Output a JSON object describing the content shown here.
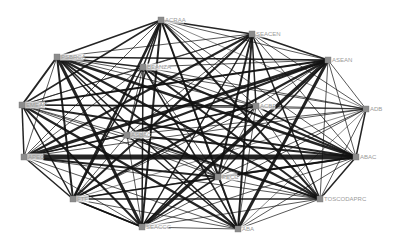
{
  "diagram": {
    "type": "network-graph",
    "nodes": [
      {
        "id": "ACRAA",
        "label": "ACRAA",
        "x": 161,
        "y": 20
      },
      {
        "id": "SEACEN",
        "label": "SEACEN",
        "x": 252,
        "y": 34
      },
      {
        "id": "ASEAN",
        "label": "ASEAN",
        "x": 328,
        "y": 60
      },
      {
        "id": "PSBRCA",
        "label": "PSBRCA",
        "x": 57,
        "y": 57
      },
      {
        "id": "BEANZA",
        "label": "BEANZA",
        "x": 143,
        "y": 67
      },
      {
        "id": "EMEAP",
        "label": "EMEAP",
        "x": 22,
        "y": 105
      },
      {
        "id": "ACBF",
        "label": "ACBF",
        "x": 256,
        "y": 106
      },
      {
        "id": "ADB",
        "label": "ADB",
        "x": 366,
        "y": 109
      },
      {
        "id": "ASBAC",
        "label": "ASBAC",
        "x": 127,
        "y": 135
      },
      {
        "id": "APEC",
        "label": "APEC",
        "x": 24,
        "y": 157
      },
      {
        "id": "ABAC",
        "label": "ABAC",
        "x": 356,
        "y": 157
      },
      {
        "id": "PECC",
        "label": "PECC",
        "x": 218,
        "y": 177
      },
      {
        "id": "FTF",
        "label": "FTF",
        "x": 73,
        "y": 199
      },
      {
        "id": "TOSCODAPRC",
        "label": "TOSCODAPRC",
        "x": 320,
        "y": 199
      },
      {
        "id": "ABA",
        "label": "ABA",
        "x": 238,
        "y": 229
      },
      {
        "id": "SEACCC",
        "label": "SEACCC",
        "x": 142,
        "y": 227
      }
    ],
    "edges": [
      [
        "APEC",
        "ABAC",
        5
      ],
      [
        "ASEAN",
        "SEACCC",
        3.5
      ],
      [
        "ASEAN",
        "ABA",
        3
      ],
      [
        "ASEAN",
        "APEC",
        3
      ],
      [
        "PSBRCA",
        "SEACCC",
        3
      ],
      [
        "PSBRCA",
        "TOSCODAPRC",
        2.5
      ],
      [
        "PSBRCA",
        "ABAC",
        2.5
      ],
      [
        "PSBRCA",
        "PECC",
        2
      ],
      [
        "EMEAP",
        "ABA",
        2.5
      ],
      [
        "EMEAP",
        "ABAC",
        2
      ],
      [
        "EMEAP",
        "SEACCC",
        2
      ],
      [
        "EMEAP",
        "ASEAN",
        2
      ],
      [
        "ACRAA",
        "SEACCC",
        2
      ],
      [
        "ACRAA",
        "FTF",
        2.5
      ],
      [
        "ACRAA",
        "TOSCODAPRC",
        2
      ],
      [
        "ACRAA",
        "ABA",
        2
      ],
      [
        "SEACEN",
        "FTF",
        2
      ],
      [
        "SEACEN",
        "APEC",
        2
      ],
      [
        "SEACEN",
        "PECC",
        2
      ],
      [
        "SEACEN",
        "ABA",
        2
      ],
      [
        "BEANZA",
        "ABAC",
        2
      ],
      [
        "BEANZA",
        "TOSCODAPRC",
        2
      ],
      [
        "BEANZA",
        "ABA",
        1.5
      ],
      [
        "BEANZA",
        "FTF",
        1.5
      ],
      [
        "ASBAC",
        "ABAC",
        2
      ],
      [
        "ASBAC",
        "TOSCODAPRC",
        2
      ],
      [
        "ASBAC",
        "ASEAN",
        2
      ],
      [
        "ASBAC",
        "ABA",
        1.5
      ],
      [
        "PECC",
        "ABAC",
        2
      ],
      [
        "PECC",
        "APEC",
        2
      ],
      [
        "PECC",
        "ASEAN",
        1.5
      ],
      [
        "PECC",
        "SEACCC",
        1.5
      ],
      [
        "FTF",
        "TOSCODAPRC",
        1.5
      ],
      [
        "FTF",
        "ABAC",
        1.5
      ],
      [
        "FTF",
        "ASEAN",
        2
      ],
      [
        "FTF",
        "SEACCC",
        1.5
      ],
      [
        "ACBF",
        "APEC",
        1.5
      ],
      [
        "ACBF",
        "SEACCC",
        1.5
      ],
      [
        "ACBF",
        "EMEAP",
        1.5
      ],
      [
        "ACBF",
        "ABAC",
        1.5
      ],
      [
        "ADB",
        "APEC",
        1
      ],
      [
        "ADB",
        "EMEAP",
        1
      ],
      [
        "ADB",
        "PSBRCA",
        1
      ],
      [
        "ADB",
        "SEACCC",
        1
      ],
      [
        "ACRAA",
        "PSBRCA",
        1.5
      ],
      [
        "ACRAA",
        "SEACEN",
        1.5
      ],
      [
        "SEACEN",
        "ASEAN",
        1.5
      ],
      [
        "ASEAN",
        "ADB",
        1
      ],
      [
        "ADB",
        "ABAC",
        1.5
      ],
      [
        "ABAC",
        "TOSCODAPRC",
        1.5
      ],
      [
        "TOSCODAPRC",
        "ABA",
        1
      ],
      [
        "ABA",
        "SEACCC",
        1
      ],
      [
        "SEACCC",
        "FTF",
        1.5
      ],
      [
        "FTF",
        "APEC",
        1.5
      ],
      [
        "APEC",
        "EMEAP",
        1.5
      ],
      [
        "EMEAP",
        "PSBRCA",
        2
      ],
      [
        "PSBRCA",
        "BEANZA",
        1.5
      ],
      [
        "PSBRCA",
        "ASEAN",
        1.5
      ],
      [
        "PSBRCA",
        "SEACEN",
        1
      ],
      [
        "PSBRCA",
        "ASBAC",
        1.5
      ],
      [
        "PSBRCA",
        "FTF",
        2
      ],
      [
        "PSBRCA",
        "APEC",
        1
      ],
      [
        "PSBRCA",
        "ABA",
        1.5
      ],
      [
        "PSBRCA",
        "ACBF",
        1
      ],
      [
        "ACRAA",
        "BEANZA",
        1.5
      ],
      [
        "ACRAA",
        "ASEAN",
        1
      ],
      [
        "ACRAA",
        "EMEAP",
        1.5
      ],
      [
        "ACRAA",
        "ACBF",
        1
      ],
      [
        "ACRAA",
        "ADB",
        0.7
      ],
      [
        "ACRAA",
        "ABAC",
        1
      ],
      [
        "ACRAA",
        "ASBAC",
        1.5
      ],
      [
        "ACRAA",
        "PECC",
        1
      ],
      [
        "ACRAA",
        "APEC",
        1
      ],
      [
        "SEACEN",
        "BEANZA",
        1
      ],
      [
        "SEACEN",
        "EMEAP",
        1
      ],
      [
        "SEACEN",
        "ACBF",
        1.5
      ],
      [
        "SEACEN",
        "ADB",
        1
      ],
      [
        "SEACEN",
        "ABAC",
        1
      ],
      [
        "SEACEN",
        "TOSCODAPRC",
        1.5
      ],
      [
        "SEACEN",
        "ASBAC",
        1
      ],
      [
        "SEACEN",
        "SEACCC",
        1.5
      ],
      [
        "ASEAN",
        "BEANZA",
        1
      ],
      [
        "ASEAN",
        "EMEAP",
        1
      ],
      [
        "ASEAN",
        "ACBF",
        1
      ],
      [
        "ASEAN",
        "ABAC",
        1
      ],
      [
        "ASEAN",
        "TOSCODAPRC",
        1
      ],
      [
        "BEANZA",
        "EMEAP",
        1
      ],
      [
        "BEANZA",
        "ACBF",
        1
      ],
      [
        "BEANZA",
        "ADB",
        1
      ],
      [
        "BEANZA",
        "ASBAC",
        1
      ],
      [
        "BEANZA",
        "APEC",
        1
      ],
      [
        "BEANZA",
        "PECC",
        1
      ],
      [
        "BEANZA",
        "SEACCC",
        1.5
      ],
      [
        "EMEAP",
        "ASBAC",
        1
      ],
      [
        "EMEAP",
        "TOSCODAPRC",
        1
      ],
      [
        "EMEAP",
        "PECC",
        1
      ],
      [
        "EMEAP",
        "FTF",
        1.5
      ],
      [
        "ACBF",
        "ADB",
        1
      ],
      [
        "ACBF",
        "ASBAC",
        1
      ],
      [
        "ACBF",
        "PECC",
        1
      ],
      [
        "ACBF",
        "TOSCODAPRC",
        1
      ],
      [
        "ACBF",
        "ABA",
        1
      ],
      [
        "ACBF",
        "FTF",
        1
      ],
      [
        "ADB",
        "ASBAC",
        1
      ],
      [
        "ADB",
        "PECC",
        1
      ],
      [
        "ADB",
        "TOSCODAPRC",
        1
      ],
      [
        "ADB",
        "ABA",
        0.7
      ],
      [
        "ADB",
        "FTF",
        0.7
      ],
      [
        "ASBAC",
        "APEC",
        1
      ],
      [
        "ASBAC",
        "PECC",
        1
      ],
      [
        "ASBAC",
        "FTF",
        1
      ],
      [
        "ASBAC",
        "SEACCC",
        1
      ],
      [
        "APEC",
        "TOSCODAPRC",
        1
      ],
      [
        "APEC",
        "ABA",
        1
      ],
      [
        "APEC",
        "SEACCC",
        1
      ],
      [
        "ABAC",
        "ABA",
        1
      ],
      [
        "ABAC",
        "SEACCC",
        1
      ],
      [
        "PECC",
        "TOSCODAPRC",
        1
      ],
      [
        "PECC",
        "ABA",
        1
      ],
      [
        "PECC",
        "FTF",
        1
      ],
      [
        "TOSCODAPRC",
        "SEACCC",
        1
      ],
      [
        "FTF",
        "ABA",
        1
      ]
    ],
    "colors": {
      "edge": "#111111",
      "node": "#8c8c8c",
      "label": "#9a9a9a",
      "background": "#ffffff"
    }
  }
}
